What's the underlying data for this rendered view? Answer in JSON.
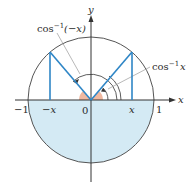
{
  "diagram": {
    "axes": {
      "x_label": "x",
      "y_label": "y"
    },
    "ticks": {
      "neg_one": "−1",
      "neg_x": "−x",
      "zero": "0",
      "pos_x": "x",
      "one": "1"
    },
    "labels": {
      "arccos_neg_x": {
        "func": "cos",
        "exp": "−1",
        "arg": "(−x)"
      },
      "arccos_x": {
        "func": "cos",
        "exp": "−1",
        "arg": "x"
      }
    },
    "colors": {
      "circle": "#555555",
      "lower_fill": "#d4eaf4",
      "segments": "#2f86c6",
      "wedge": "#f0b8a0",
      "axis": "#333333",
      "leader": "#888888"
    }
  }
}
